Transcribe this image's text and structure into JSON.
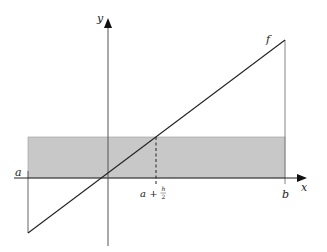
{
  "diagram": {
    "labels": {
      "y_axis": "y",
      "x_axis": "x",
      "function": "f",
      "left_endpoint": "a",
      "right_endpoint": "b",
      "midpoint_prefix": "a +",
      "midpoint_frac_num": "h",
      "midpoint_frac_den": "2"
    },
    "colors": {
      "shaded_region": "#c8c8c8",
      "lines": "#333333",
      "background": "#ffffff"
    },
    "elements": [
      "x-axis with arrow",
      "y-axis with arrow",
      "line f through near origin",
      "shaded rectangle from a to b with height f(a + h/2)",
      "dashed vertical line at a + h/2",
      "vertical segments at a and b to f"
    ]
  }
}
